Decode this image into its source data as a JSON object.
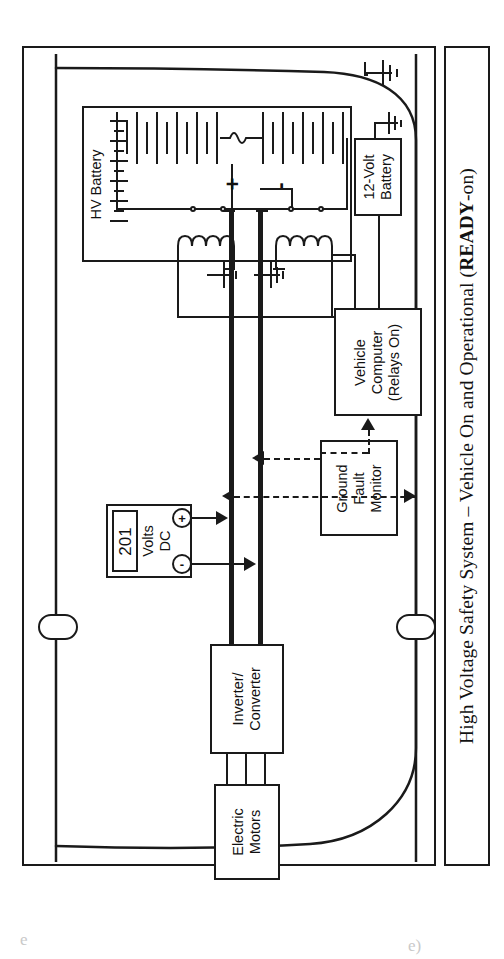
{
  "figure": {
    "caption_prefix": "High Voltage Safety System – Vehicle On and Operational (",
    "caption_bold": "READY",
    "caption_suffix": "-on)",
    "caption_full": "High Voltage Safety System – Vehicle On and Operational (READY-on)"
  },
  "blocks": {
    "hv_battery": {
      "label": "HV Battery"
    },
    "battery_12v": {
      "line1": "12-Volt",
      "line2": "Battery"
    },
    "vehicle_computer": {
      "line1": "Vehicle",
      "line2": "Computer",
      "line3": "(Relays On)"
    },
    "ground_fault_monitor": {
      "line1": "Ground",
      "line2": "Fault",
      "line3": "Monitor"
    },
    "voltmeter": {
      "value": "201",
      "unit_line1": "Volts",
      "unit_line2": "DC",
      "terminal_positive": "+",
      "terminal_negative": "-"
    },
    "inverter": {
      "line1": "Inverter/",
      "line2": "Converter"
    },
    "motors": {
      "line1": "Electric",
      "line2": "Motors"
    }
  },
  "polarity": {
    "positive": "+",
    "negative": "-"
  },
  "icons": {
    "chassis_ground": "ground-icon",
    "relay_coil": "coil-icon",
    "relay_contact": "contact-icon",
    "fuse": "fuse-icon",
    "battery_cells": "battery-cell-icon",
    "wheel": "wheel-icon"
  },
  "colors": {
    "ink": "#1a1a1a",
    "paper": "#ffffff",
    "bus": "#0a0a0a"
  },
  "scan_artifacts": {
    "left": "e",
    "right": "e)"
  }
}
